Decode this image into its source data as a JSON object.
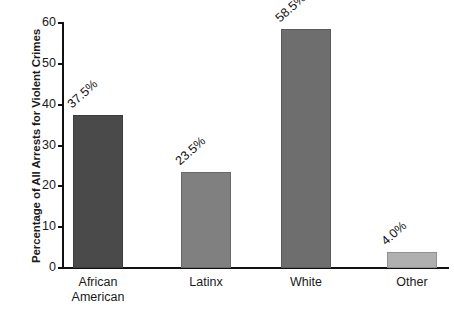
{
  "chart_data": {
    "type": "bar",
    "title": "",
    "xlabel": "",
    "ylabel": "Percentage of All Arrests for Violent Crimes",
    "categories": [
      "African\nAmerican",
      "Latinx",
      "White",
      "Other"
    ],
    "values": [
      37.5,
      23.5,
      58.5,
      4.0
    ],
    "value_labels": [
      "37.5%",
      "23.5%",
      "58.5%",
      "4.0%"
    ],
    "bar_colors": [
      "#4a4a4a",
      "#808080",
      "#6e6e6e",
      "#b0b0b0"
    ],
    "ylim": [
      0,
      60
    ],
    "yticks": [
      0,
      10,
      20,
      30,
      40,
      50,
      60
    ],
    "ytick_labels": [
      "0",
      "10",
      "20",
      "30",
      "40",
      "50",
      "60"
    ],
    "grid": false,
    "legend": "none",
    "axis_color": "#111111"
  }
}
